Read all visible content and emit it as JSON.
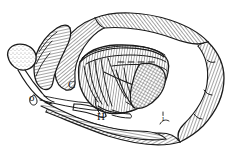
{
  "figure": {
    "caption": "",
    "background_color": "#ffffff",
    "ink_color": "#1a1a1a",
    "width": 235,
    "height": 159,
    "style": "pen-and-ink hatched line art"
  },
  "labels": [
    {
      "id": "label-c",
      "text": "C",
      "x": 68,
      "y": 88,
      "font_size": 11
    },
    {
      "id": "label-h",
      "text": "H",
      "x": 97,
      "y": 120,
      "font_size": 11
    },
    {
      "id": "label-o",
      "text": "o",
      "x": 31,
      "y": 101,
      "font_size": 11
    },
    {
      "id": "label-i",
      "text": "i",
      "x": 163,
      "y": 120,
      "font_size": 8
    }
  ],
  "structures": [
    {
      "id": "outer-ring",
      "name": "coiled tubular organ (outer ring)",
      "texture": "perpendicular fine hatching",
      "fill": "#ffffff"
    },
    {
      "id": "central-mass",
      "name": "central hatched mass",
      "texture": "dense vertical hatching",
      "fill": "#ffffff"
    },
    {
      "id": "right-lobe",
      "name": "cross-hatched right lobe",
      "texture": "cross-hatch mesh",
      "fill": "#ffffff"
    },
    {
      "id": "paddle-appendage",
      "name": "paddle-shaped appendage",
      "texture": "stippled tip",
      "fill": "#ffffff"
    },
    {
      "id": "upper-left-lobe",
      "name": "upper-left hatched lobe",
      "texture": "parallel hatching",
      "fill": "#ffffff"
    },
    {
      "id": "lower-band",
      "name": "lower hatched band",
      "texture": "parallel hatching",
      "fill": "#ffffff"
    }
  ]
}
